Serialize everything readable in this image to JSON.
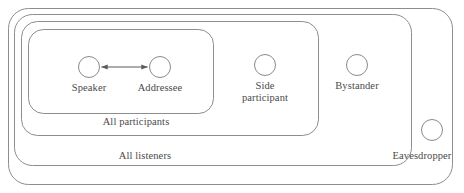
{
  "diagram": {
    "type": "nested-set-venn",
    "colors": {
      "stroke": "#8d8d8d",
      "arrow": "#5a5a5a",
      "text": "#4a4a4a",
      "background": "#ffffff"
    },
    "groups": [
      {
        "id": "all-listeners-outer",
        "label": "",
        "level": 0,
        "note": "outermost unlabeled boundary enclosing everyone"
      },
      {
        "id": "all-listeners",
        "label": "All listeners",
        "level": 1
      },
      {
        "id": "all-participants",
        "label": "All participants",
        "level": 2
      },
      {
        "id": "speaker-addressee",
        "label": "",
        "level": 3,
        "note": "innermost box containing speaker and addressee"
      }
    ],
    "nodes": [
      {
        "id": "speaker",
        "label": "Speaker",
        "group": "speaker-addressee"
      },
      {
        "id": "addressee",
        "label": "Addressee",
        "group": "speaker-addressee"
      },
      {
        "id": "side-participant",
        "label": "Side\nparticipant",
        "group": "all-participants"
      },
      {
        "id": "bystander",
        "label": "Bystander",
        "group": "all-listeners"
      },
      {
        "id": "eavesdropper",
        "label": "Eavesdropper",
        "group": "all-listeners-outer"
      }
    ],
    "links": [
      {
        "id": "speaker-addressee-link",
        "from": "speaker",
        "to": "addressee",
        "arrow": "double"
      }
    ]
  }
}
